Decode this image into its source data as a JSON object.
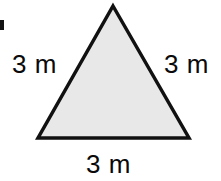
{
  "figure": {
    "shape": "triangle",
    "unit": "m",
    "background_color": "#ffffff",
    "fill_color": "#e8e8e8",
    "stroke_color": "#111111",
    "stroke_width": 3.5,
    "text_color": "#0a0a0a",
    "vertices": {
      "apex": {
        "x": 113,
        "y": 6
      },
      "bottom_left": {
        "x": 38,
        "y": 138
      },
      "bottom_right": {
        "x": 189,
        "y": 138
      }
    },
    "labels": {
      "left_side": "3 m",
      "right_side": "3 m",
      "bottom_side": "3 m"
    },
    "artifact": {
      "name": "scan-edge-mark",
      "color": "#121212"
    }
  },
  "chart_data": {
    "type": "diagram",
    "shape": "triangle",
    "sides": [
      {
        "name": "left",
        "length": 3,
        "unit": "m",
        "label": "3 m"
      },
      {
        "name": "right",
        "length": 3,
        "unit": "m",
        "label": "3 m"
      },
      {
        "name": "bottom",
        "length": 3,
        "unit": "m",
        "label": "3 m"
      }
    ],
    "vertices": [
      [
        113,
        6
      ],
      [
        189,
        138
      ],
      [
        38,
        138
      ]
    ],
    "fill": "#e8e8e8",
    "stroke": "#111111",
    "annotations": [
      "3 m",
      "3 m",
      "3 m"
    ]
  }
}
